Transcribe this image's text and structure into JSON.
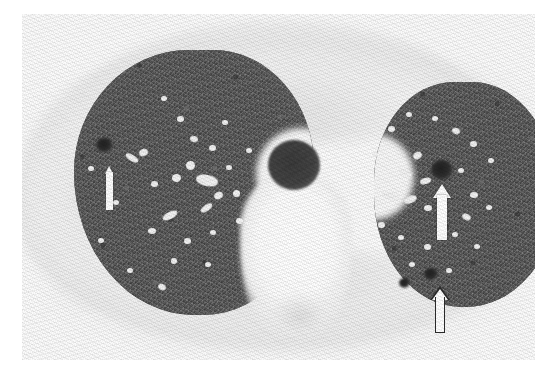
{
  "image": {
    "modality_label": "Axial chest CT",
    "window_label": "lung window",
    "caption": ""
  },
  "anatomy": {
    "trachea_label": "trachea",
    "mediastinum_label": "mediastinum",
    "chest_wall_label": "chest wall",
    "right_lung_label": "right lung",
    "left_lung_label": "left lung"
  },
  "annotations": [
    {
      "id": "arrow-right-lung",
      "style": "solid-white-bar",
      "direction": "up",
      "x": 105,
      "y": 166,
      "width": 9,
      "height": 44,
      "target": "right lung low-attenuation focus"
    },
    {
      "id": "arrow-left-lung-nodule",
      "style": "solid-white",
      "direction": "up",
      "x": 433,
      "y": 184,
      "width": 18,
      "height": 56,
      "target": "left lung dark nodule / cyst"
    },
    {
      "id": "arrow-left-lung-base",
      "style": "outlined-white",
      "direction": "up",
      "x": 430,
      "y": 286,
      "width": 20,
      "height": 48,
      "target": "left lower lobe subpleural change"
    }
  ],
  "palette": {
    "background": "#ffffff",
    "lung_parenchyma": "#585858",
    "vessel": "#f2f2f2",
    "lesion": "#202020",
    "trachea": "#3a3a3a",
    "mediastinum": "#ffffff",
    "arrow_fill": "#ffffff",
    "arrow_outline": "#2b2b2b"
  },
  "vessels": {
    "right_lung": [
      {
        "x": 88,
        "y": 166,
        "w": 6,
        "h": 5,
        "r": 0
      },
      {
        "x": 125,
        "y": 155,
        "w": 14,
        "h": 6,
        "r": 32
      },
      {
        "x": 139,
        "y": 149,
        "w": 9,
        "h": 7,
        "r": -20
      },
      {
        "x": 161,
        "y": 96,
        "w": 6,
        "h": 5,
        "r": 0
      },
      {
        "x": 177,
        "y": 116,
        "w": 7,
        "h": 6,
        "r": 0
      },
      {
        "x": 190,
        "y": 136,
        "w": 8,
        "h": 6,
        "r": 15
      },
      {
        "x": 196,
        "y": 175,
        "w": 22,
        "h": 11,
        "r": 12
      },
      {
        "x": 172,
        "y": 174,
        "w": 9,
        "h": 8,
        "r": 0
      },
      {
        "x": 151,
        "y": 181,
        "w": 7,
        "h": 6,
        "r": 0
      },
      {
        "x": 186,
        "y": 161,
        "w": 9,
        "h": 9,
        "r": 0
      },
      {
        "x": 209,
        "y": 145,
        "w": 7,
        "h": 6,
        "r": 0
      },
      {
        "x": 222,
        "y": 120,
        "w": 6,
        "h": 5,
        "r": 0
      },
      {
        "x": 214,
        "y": 192,
        "w": 9,
        "h": 7,
        "r": -25
      },
      {
        "x": 200,
        "y": 205,
        "w": 13,
        "h": 6,
        "r": -35
      },
      {
        "x": 233,
        "y": 190,
        "w": 7,
        "h": 7,
        "r": 0
      },
      {
        "x": 162,
        "y": 212,
        "w": 16,
        "h": 7,
        "r": -28
      },
      {
        "x": 148,
        "y": 228,
        "w": 8,
        "h": 6,
        "r": 0
      },
      {
        "x": 184,
        "y": 238,
        "w": 7,
        "h": 6,
        "r": 0
      },
      {
        "x": 210,
        "y": 230,
        "w": 6,
        "h": 5,
        "r": 0
      },
      {
        "x": 236,
        "y": 218,
        "w": 7,
        "h": 6,
        "r": 0
      },
      {
        "x": 171,
        "y": 258,
        "w": 6,
        "h": 6,
        "r": 0
      },
      {
        "x": 205,
        "y": 262,
        "w": 6,
        "h": 5,
        "r": 0
      },
      {
        "x": 113,
        "y": 200,
        "w": 6,
        "h": 5,
        "r": 0
      },
      {
        "x": 98,
        "y": 238,
        "w": 6,
        "h": 5,
        "r": 0
      },
      {
        "x": 127,
        "y": 268,
        "w": 6,
        "h": 5,
        "r": 0
      },
      {
        "x": 158,
        "y": 284,
        "w": 8,
        "h": 6,
        "r": 25
      },
      {
        "x": 226,
        "y": 165,
        "w": 6,
        "h": 5,
        "r": 0
      },
      {
        "x": 246,
        "y": 148,
        "w": 6,
        "h": 5,
        "r": 0
      }
    ],
    "left_lung": [
      {
        "x": 388,
        "y": 126,
        "w": 7,
        "h": 6,
        "r": 0
      },
      {
        "x": 406,
        "y": 112,
        "w": 6,
        "h": 5,
        "r": 0
      },
      {
        "x": 432,
        "y": 116,
        "w": 6,
        "h": 5,
        "r": 0
      },
      {
        "x": 452,
        "y": 128,
        "w": 8,
        "h": 6,
        "r": 20
      },
      {
        "x": 470,
        "y": 141,
        "w": 7,
        "h": 6,
        "r": 0
      },
      {
        "x": 488,
        "y": 158,
        "w": 6,
        "h": 5,
        "r": 0
      },
      {
        "x": 413,
        "y": 152,
        "w": 9,
        "h": 7,
        "r": -30
      },
      {
        "x": 398,
        "y": 170,
        "w": 14,
        "h": 7,
        "r": 18
      },
      {
        "x": 420,
        "y": 178,
        "w": 11,
        "h": 6,
        "r": -15
      },
      {
        "x": 382,
        "y": 192,
        "w": 18,
        "h": 8,
        "r": 10
      },
      {
        "x": 404,
        "y": 196,
        "w": 13,
        "h": 7,
        "r": -22
      },
      {
        "x": 424,
        "y": 205,
        "w": 8,
        "h": 6,
        "r": 0
      },
      {
        "x": 458,
        "y": 168,
        "w": 6,
        "h": 5,
        "r": 0
      },
      {
        "x": 470,
        "y": 192,
        "w": 8,
        "h": 6,
        "r": 0
      },
      {
        "x": 486,
        "y": 205,
        "w": 6,
        "h": 5,
        "r": 0
      },
      {
        "x": 378,
        "y": 222,
        "w": 7,
        "h": 6,
        "r": 0
      },
      {
        "x": 398,
        "y": 235,
        "w": 6,
        "h": 5,
        "r": 0
      },
      {
        "x": 424,
        "y": 244,
        "w": 7,
        "h": 6,
        "r": 0
      },
      {
        "x": 452,
        "y": 232,
        "w": 6,
        "h": 5,
        "r": 0
      },
      {
        "x": 474,
        "y": 244,
        "w": 6,
        "h": 5,
        "r": 0
      },
      {
        "x": 409,
        "y": 262,
        "w": 6,
        "h": 5,
        "r": 0
      },
      {
        "x": 446,
        "y": 268,
        "w": 6,
        "h": 5,
        "r": 0
      },
      {
        "x": 462,
        "y": 214,
        "w": 9,
        "h": 6,
        "r": 25
      },
      {
        "x": 372,
        "y": 152,
        "w": 6,
        "h": 5,
        "r": 0
      }
    ]
  },
  "lesions": [
    {
      "x": 96,
      "y": 138,
      "w": 17,
      "h": 14,
      "label": "right lung dark focus"
    },
    {
      "x": 431,
      "y": 160,
      "w": 22,
      "h": 20,
      "label": "left lung dark nodule"
    },
    {
      "x": 424,
      "y": 268,
      "w": 14,
      "h": 12,
      "label": "left lower lobe focus"
    },
    {
      "x": 399,
      "y": 278,
      "w": 11,
      "h": 10,
      "label": "left basal focus"
    }
  ]
}
